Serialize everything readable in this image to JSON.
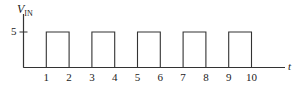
{
  "chart_data": {
    "type": "line",
    "title": "",
    "ylabel": "V",
    "ylabel_sub": "IN",
    "xlabel": "t",
    "x_ticks": [
      "1",
      "2",
      "3",
      "4",
      "5",
      "6",
      "7",
      "8",
      "9",
      "10"
    ],
    "y_ticks": [
      "5"
    ],
    "ylim": [
      0,
      5
    ],
    "xlim": [
      0,
      11.2
    ],
    "grid": false,
    "legend": null,
    "series": [
      {
        "name": "V_IN square wave",
        "x": [
          0,
          1,
          1,
          2,
          2,
          3,
          3,
          4,
          4,
          5,
          5,
          6,
          6,
          7,
          7,
          8,
          8,
          9,
          9,
          10,
          10,
          11.2
        ],
        "values": [
          0,
          0,
          5,
          5,
          0,
          0,
          5,
          5,
          0,
          0,
          5,
          5,
          0,
          0,
          5,
          5,
          0,
          0,
          5,
          5,
          0,
          0
        ]
      }
    ],
    "color": "#333333"
  }
}
